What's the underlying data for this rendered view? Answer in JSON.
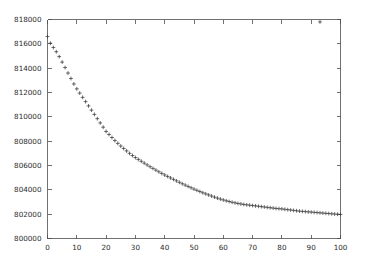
{
  "figure": {
    "background_color": "#ffffff",
    "axis_color": "#4d4d4d",
    "marker_color": "#3a3a3a",
    "marker_symbol": "+",
    "title": "",
    "legend": ""
  },
  "chart_data": {
    "type": "scatter",
    "title": "",
    "subtitle": "",
    "xlabel": "",
    "ylabel": "",
    "xlim": [
      0,
      100
    ],
    "ylim": [
      800000,
      818000
    ],
    "grid": false,
    "legend_position": "none",
    "legend_entries": [],
    "annotations": [],
    "x_ticks": [
      0,
      10,
      20,
      30,
      40,
      50,
      60,
      70,
      80,
      90,
      100
    ],
    "x_tick_labels": [
      "0",
      "10",
      "20",
      "30",
      "40",
      "50",
      "60",
      "70",
      "80",
      "90",
      "100"
    ],
    "y_ticks": [
      800000,
      802000,
      804000,
      806000,
      808000,
      810000,
      812000,
      814000,
      816000,
      818000
    ],
    "y_tick_labels": [
      "800000",
      "802000",
      "804000",
      "806000",
      "808000",
      "810000",
      "812000",
      "814000",
      "816000",
      "818000"
    ],
    "series": [
      {
        "name": "series-1",
        "marker": "+",
        "x": [
          0,
          1,
          2,
          3,
          4,
          5,
          6,
          7,
          8,
          9,
          10,
          11,
          12,
          13,
          14,
          15,
          16,
          17,
          18,
          19,
          20,
          21,
          22,
          23,
          24,
          25,
          26,
          27,
          28,
          29,
          30,
          31,
          32,
          33,
          34,
          35,
          36,
          37,
          38,
          39,
          40,
          41,
          42,
          43,
          44,
          45,
          46,
          47,
          48,
          49,
          50,
          51,
          52,
          53,
          54,
          55,
          56,
          57,
          58,
          59,
          60,
          61,
          62,
          63,
          64,
          65,
          66,
          67,
          68,
          69,
          70,
          71,
          72,
          73,
          74,
          75,
          76,
          77,
          78,
          79,
          80,
          81,
          82,
          83,
          84,
          85,
          86,
          87,
          88,
          89,
          90,
          91,
          92,
          93,
          94,
          95,
          96,
          97,
          98,
          99,
          100
        ],
        "y": [
          816600,
          816050,
          815700,
          815350,
          814950,
          814500,
          814050,
          813600,
          813150,
          812700,
          812300,
          811950,
          811600,
          811250,
          810900,
          810550,
          810200,
          809850,
          809500,
          809150,
          808800,
          808550,
          808300,
          808050,
          807820,
          807600,
          807400,
          807200,
          807000,
          806820,
          806650,
          806500,
          806350,
          806200,
          806050,
          805900,
          805760,
          805620,
          805480,
          805350,
          805220,
          805100,
          804980,
          804860,
          804740,
          804620,
          804500,
          804390,
          804280,
          804170,
          804060,
          803960,
          803860,
          803760,
          803670,
          803580,
          803490,
          803400,
          803320,
          803240,
          803170,
          803100,
          803040,
          802980,
          802930,
          802880,
          802840,
          802800,
          802770,
          802740,
          802710,
          802680,
          802650,
          802620,
          802590,
          802560,
          802530,
          802500,
          802470,
          802450,
          802430,
          802400,
          802370,
          802340,
          802310,
          802280,
          802250,
          802230,
          802210,
          802190,
          802170,
          802150,
          802130,
          802110,
          802090,
          802070,
          802050,
          802030,
          802010,
          801995,
          801980
        ]
      },
      {
        "name": "outlier",
        "marker": "+",
        "x": [
          93
        ],
        "y": [
          817800
        ]
      }
    ]
  }
}
